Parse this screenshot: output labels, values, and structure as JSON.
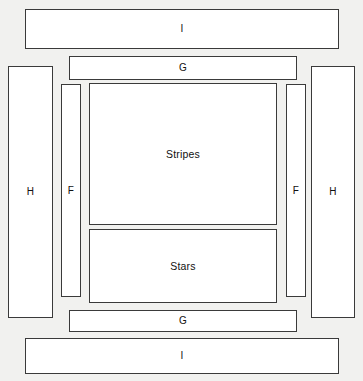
{
  "diagram": {
    "background_color": "#f1f1ef",
    "piece_fill_color": "#ffffff",
    "piece_border_color": "#3a3a3a",
    "label_color": "#111111",
    "pieces": [
      {
        "id": "border-i-top",
        "label": "I",
        "role": "outer-horizontal-border",
        "position": "top",
        "x": 25,
        "y": 9,
        "width": 314,
        "height": 40
      },
      {
        "id": "border-g-top",
        "label": "G",
        "role": "inner-horizontal-border",
        "position": "top",
        "x": 69,
        "y": 56,
        "width": 228,
        "height": 24
      },
      {
        "id": "border-h-left",
        "label": "H",
        "role": "outer-vertical-border",
        "position": "left",
        "x": 8,
        "y": 66,
        "width": 45,
        "height": 252
      },
      {
        "id": "border-f-left",
        "label": "F",
        "role": "inner-vertical-border",
        "position": "left",
        "x": 61,
        "y": 84,
        "width": 20,
        "height": 213
      },
      {
        "id": "panel-stripes",
        "label": "Stripes",
        "role": "center-panel",
        "position": "center-top",
        "x": 89,
        "y": 83,
        "width": 188,
        "height": 142
      },
      {
        "id": "panel-stars",
        "label": "Stars",
        "role": "center-panel",
        "position": "center-bottom",
        "x": 89,
        "y": 229,
        "width": 188,
        "height": 74
      },
      {
        "id": "border-f-right",
        "label": "F",
        "role": "inner-vertical-border",
        "position": "right",
        "x": 286,
        "y": 84,
        "width": 20,
        "height": 213
      },
      {
        "id": "border-h-right",
        "label": "H",
        "role": "outer-vertical-border",
        "position": "right",
        "x": 311,
        "y": 66,
        "width": 44,
        "height": 252
      },
      {
        "id": "border-g-bottom",
        "label": "G",
        "role": "inner-horizontal-border",
        "position": "bottom",
        "x": 69,
        "y": 310,
        "width": 228,
        "height": 22
      },
      {
        "id": "border-i-bottom",
        "label": "I",
        "role": "outer-horizontal-border",
        "position": "bottom",
        "x": 25,
        "y": 338,
        "width": 314,
        "height": 36
      }
    ]
  }
}
